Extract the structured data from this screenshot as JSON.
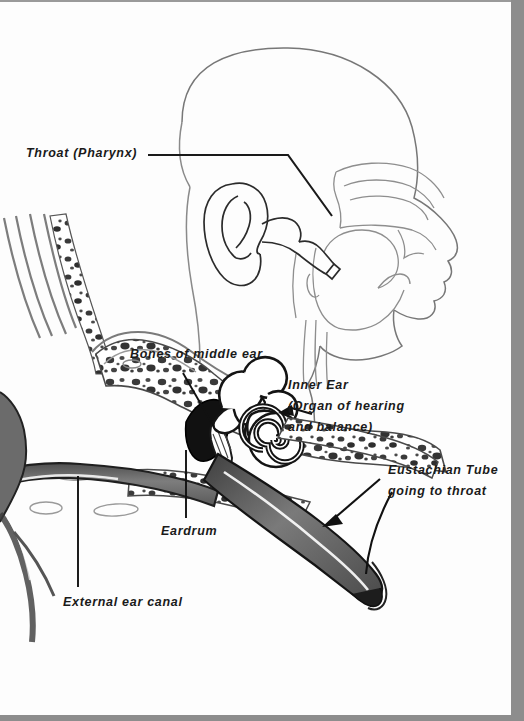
{
  "figure": {
    "kind": "anatomical-illustration",
    "background_color": "#fdfdfd",
    "frame_color": "#8d8d8d",
    "ink_color": "#1a1a1a"
  },
  "labels": {
    "throat": "Throat (Pharynx)",
    "bones_of_middle_ear": "Bones of middle ear",
    "inner_ear_line1": "Inner Ear",
    "inner_ear_line2": "(Organ of hearing",
    "inner_ear_line3": "and balance)",
    "eustachian_line1": "Eustachian Tube",
    "eustachian_line2": "going to throat",
    "eardrum": "Eardrum",
    "external_ear_canal": "External ear canal"
  },
  "parts": {
    "head_profile": "head-profile-outline",
    "pinna": "outer-ear-pinna",
    "nasal_cavity": "nasal-cavity-outline",
    "pharynx": "pharynx-outline",
    "ear_canal": "external-auditory-canal",
    "eardrum": "tympanic-membrane",
    "ossicles": "middle-ear-ossicles",
    "semicircular_canals": "semicircular-canals",
    "cochlea": "cochlea-spiral",
    "eustachian_tube": "eustachian-tube",
    "mastoid_bone": "temporal-bone-spongy"
  },
  "colors": {
    "canal_fill": "#6f6f6f",
    "tube_fill": "#636363",
    "bone_speck": "#3a3a3a",
    "outline": "#2b2b2b",
    "dark_cavity": "#111111"
  }
}
